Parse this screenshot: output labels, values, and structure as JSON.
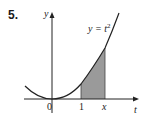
{
  "problem": {
    "number": "5."
  },
  "axes": {
    "x_label": "t",
    "y_label": "y",
    "origin_label": "0"
  },
  "ticks": [
    {
      "label": "1",
      "value": 1
    },
    {
      "label": "x",
      "value": 1.83
    }
  ],
  "curve": {
    "label_lhs": "y = t",
    "label_exp": "2",
    "equation": "y = t^2"
  },
  "shading": {
    "from": "1",
    "to": "x",
    "color": "#999999"
  }
}
